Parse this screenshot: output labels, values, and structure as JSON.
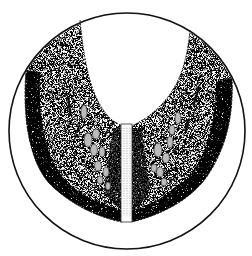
{
  "figure": {
    "background_color": "#ffffff",
    "ink_color": "#111111",
    "frame": {
      "shape": "circle",
      "cx": 127,
      "cy": 131,
      "r": 118
    }
  }
}
